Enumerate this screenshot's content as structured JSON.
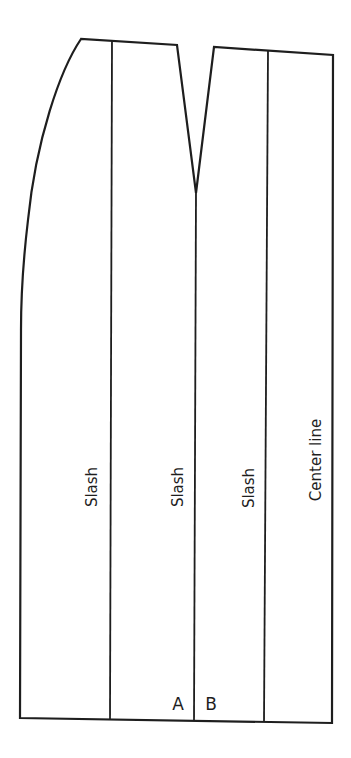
{
  "diagram": {
    "type": "skirt-pattern-slash-diagram",
    "labels": {
      "slash_1": "Slash",
      "slash_2": "Slash",
      "slash_3": "Slash",
      "center_line": "Center line",
      "point_a": "A",
      "point_b": "B"
    },
    "colors": {
      "line": "#1e1e1e",
      "background": "#ffffff"
    }
  }
}
